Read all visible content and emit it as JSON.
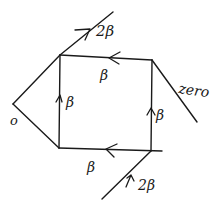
{
  "diagram": {
    "type": "hand-drawn flow diagram",
    "colors": {
      "ink": "#1a1a1a",
      "background": "#ffffff"
    },
    "labels": {
      "top_external": "2β",
      "top_edge": "β",
      "left_edge": "β",
      "right_edge": "β",
      "bottom_edge": "β",
      "bottom_external": "2β",
      "right_external": "zero",
      "left_external": "o"
    }
  }
}
